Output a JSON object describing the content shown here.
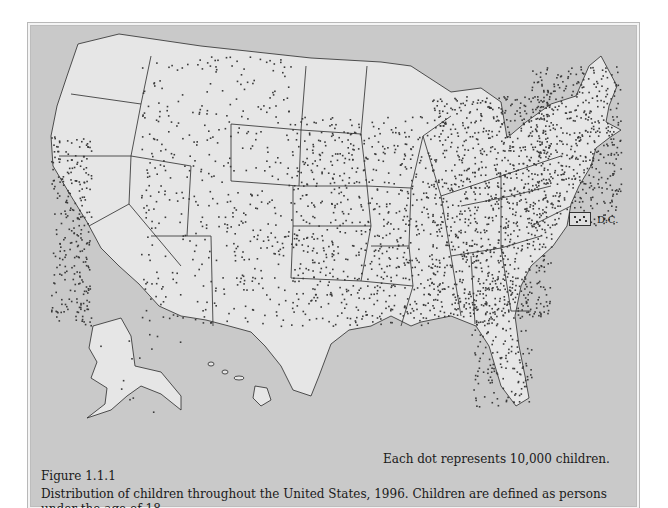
{
  "figure": {
    "label": "Figure 1.1.1",
    "caption": "Distribution of children throughout the United States, 1996. Children are defined as persons under the age of 18.",
    "dot_note": "Each dot represents 10,000 children."
  },
  "legend": {
    "dc_label": "D.C."
  },
  "map": {
    "type": "dot-density",
    "region": "United States (incl. Alaska and Hawaii insets)",
    "dot_value": 10000,
    "colors": {
      "background": "#c9c9c9",
      "land": "#e6e6e6",
      "border": "#2a2a2a",
      "dot": "#3a3a3a"
    }
  }
}
